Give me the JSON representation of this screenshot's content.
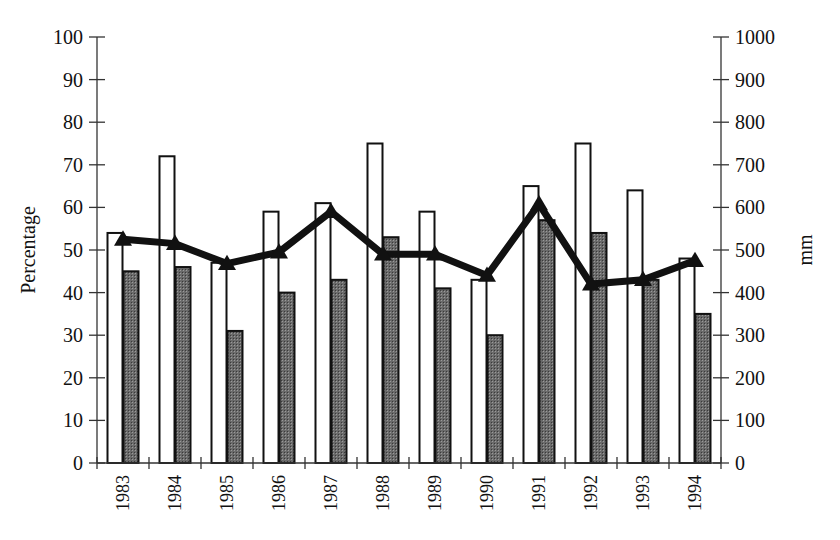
{
  "chart_data": {
    "type": "bar",
    "title": "",
    "categories": [
      "1983",
      "1984",
      "1985",
      "1986",
      "1987",
      "1988",
      "1989",
      "1990",
      "1991",
      "1992",
      "1993",
      "1994"
    ],
    "series": [
      {
        "name": "Series 1 (open bars)",
        "axis": "left",
        "kind": "bar",
        "fill": "#ffffff",
        "values": [
          54,
          72,
          47,
          59,
          61,
          75,
          59,
          43,
          65,
          75,
          64,
          48
        ]
      },
      {
        "name": "Series 2 (shaded bars)",
        "axis": "left",
        "kind": "bar",
        "fill": "#555555",
        "values": [
          45,
          46,
          31,
          40,
          43,
          53,
          41,
          30,
          57,
          54,
          43,
          35
        ]
      },
      {
        "name": "Series 3 (line, triangles)",
        "axis": "right",
        "kind": "line",
        "marker": "triangle",
        "values": [
          525,
          515,
          468,
          495,
          590,
          490,
          490,
          440,
          608,
          420,
          430,
          475
        ]
      }
    ],
    "xlabel": "",
    "ylabel": "Percentage",
    "ylabel_right": "mm",
    "ylim": [
      0,
      100
    ],
    "ylim_right": [
      0,
      1000
    ],
    "yticks": [
      0,
      10,
      20,
      30,
      40,
      50,
      60,
      70,
      80,
      90,
      100
    ],
    "yticks_right": [
      0,
      100,
      200,
      300,
      400,
      500,
      600,
      700,
      800,
      900,
      1000
    ],
    "grid": false,
    "legend": "none"
  }
}
